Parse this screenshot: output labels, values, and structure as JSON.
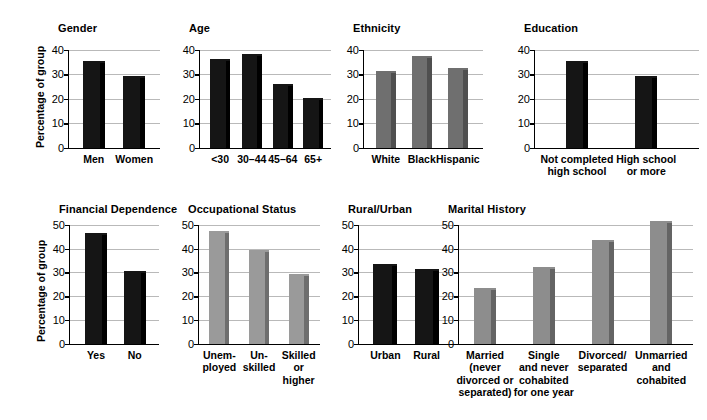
{
  "figure": {
    "ylabel": "Percentage of group",
    "bar_colors": {
      "black": "#151515",
      "black_edge": "#000000",
      "dark_gray": "#6f6f6f",
      "dark_gray_edge": "#4f4f4f",
      "mid_gray": "#8d8d8d",
      "mid_gray_edge": "#646464",
      "light_gray": "#9a9a9a",
      "light_gray_edge": "#6e6e6e",
      "gridline": "#b9b9b9",
      "axis": "#000000"
    }
  },
  "chart_data": [
    {
      "type": "bar",
      "title": "Gender",
      "xlabel": "",
      "ylabel": "Percentage of group",
      "ylim": [
        0,
        40
      ],
      "yticks": [
        0,
        10,
        20,
        30,
        40
      ],
      "grid": true,
      "bar_style": "black",
      "categories": [
        "Men",
        "Women"
      ],
      "values": [
        35.5,
        29.5
      ]
    },
    {
      "type": "bar",
      "title": "Age",
      "xlabel": "",
      "ylabel": "",
      "ylim": [
        0,
        40
      ],
      "yticks": [
        0,
        10,
        20,
        30,
        40
      ],
      "grid": true,
      "bar_style": "black",
      "categories": [
        "<30",
        "30–44",
        "45–64",
        "65+"
      ],
      "values": [
        36.5,
        38.5,
        26.0,
        20.5
      ]
    },
    {
      "type": "bar",
      "title": "Ethnicity",
      "xlabel": "",
      "ylabel": "",
      "ylim": [
        0,
        40
      ],
      "yticks": [
        0,
        10,
        20,
        30,
        40
      ],
      "grid": true,
      "bar_style": "dark_gray",
      "categories": [
        "White",
        "Black",
        "Hispanic"
      ],
      "values": [
        31.5,
        37.5,
        32.5
      ]
    },
    {
      "type": "bar",
      "title": "Education",
      "xlabel": "",
      "ylabel": "",
      "ylim": [
        0,
        40
      ],
      "yticks": [
        0,
        10,
        20,
        30,
        40
      ],
      "grid": true,
      "bar_style": "black",
      "categories": [
        "Not completed\nhigh school",
        "High school\nor more"
      ],
      "values": [
        35.5,
        29.5
      ]
    },
    {
      "type": "bar",
      "title": "Financial Dependence",
      "xlabel": "",
      "ylabel": "Percentage of group",
      "ylim": [
        0,
        50
      ],
      "yticks": [
        0,
        10,
        20,
        30,
        40,
        50
      ],
      "grid": true,
      "bar_style": "black",
      "categories": [
        "Yes",
        "No"
      ],
      "values": [
        46.5,
        30.5
      ]
    },
    {
      "type": "bar",
      "title": "Occupational Status",
      "xlabel": "",
      "ylabel": "",
      "ylim": [
        0,
        50
      ],
      "yticks": [
        0,
        10,
        20,
        30,
        40,
        50
      ],
      "grid": true,
      "bar_style": "light_gray",
      "categories": [
        "Unem-\nployed",
        "Un-\nskilled",
        "Skilled\nor\nhigher"
      ],
      "values": [
        47.5,
        39.5,
        29.5
      ]
    },
    {
      "type": "bar",
      "title": "Rural/Urban",
      "xlabel": "",
      "ylabel": "",
      "ylim": [
        0,
        50
      ],
      "yticks": [
        0,
        10,
        20,
        30,
        40,
        50
      ],
      "grid": true,
      "bar_style": "black",
      "categories": [
        "Urban",
        "Rural"
      ],
      "values": [
        33.5,
        31.5
      ]
    },
    {
      "type": "bar",
      "title": "Marital History",
      "xlabel": "",
      "ylabel": "",
      "ylim": [
        0,
        50
      ],
      "yticks": [
        0,
        10,
        20,
        30,
        40,
        50
      ],
      "grid": true,
      "bar_style": "mid_gray",
      "categories": [
        "Married\n(never\ndivorced or\nseparated)",
        "Single\nand never\ncohabited\nfor one year",
        "Divorced/\nseparated",
        "Unmarried\nand\ncohabited"
      ],
      "values": [
        23.5,
        32.5,
        43.5,
        51.5
      ]
    }
  ],
  "layout": [
    {
      "title_x": 58,
      "title_y": 22,
      "plot_x": 68,
      "plot_y": 50,
      "plot_w": 92,
      "plot_h": 99,
      "ylabel_x": 34,
      "ylabel_y": 148,
      "bar_w": 22,
      "label_w": 54,
      "slots": [
        0.28,
        0.72
      ]
    },
    {
      "title_x": 189,
      "title_y": 22,
      "plot_x": 199,
      "plot_y": 50,
      "plot_w": 132,
      "plot_h": 99,
      "bar_w": 20,
      "label_w": 34,
      "slots": [
        0.16,
        0.4,
        0.635,
        0.865
      ]
    },
    {
      "title_x": 353,
      "title_y": 22,
      "plot_x": 363,
      "plot_y": 50,
      "plot_w": 120,
      "plot_h": 99,
      "bar_w": 20,
      "label_w": 48,
      "slots": [
        0.19,
        0.49,
        0.79
      ]
    },
    {
      "title_x": 524,
      "title_y": 22,
      "plot_x": 534,
      "plot_y": 50,
      "plot_w": 165,
      "plot_h": 99,
      "bar_w": 22,
      "label_w": 90,
      "slots": [
        0.26,
        0.68
      ]
    },
    {
      "title_x": 59,
      "title_y": 203,
      "plot_x": 69,
      "plot_y": 225,
      "plot_w": 90,
      "plot_h": 120,
      "ylabel_x": 35,
      "ylabel_y": 342,
      "bar_w": 22,
      "label_w": 40,
      "slots": [
        0.3,
        0.73
      ]
    },
    {
      "title_x": 188,
      "title_y": 203,
      "plot_x": 198,
      "plot_y": 225,
      "plot_w": 122,
      "plot_h": 120,
      "bar_w": 20,
      "label_w": 44,
      "slots": [
        0.175,
        0.5,
        0.825
      ]
    },
    {
      "title_x": 348,
      "title_y": 203,
      "plot_x": 358,
      "plot_y": 225,
      "plot_w": 98,
      "plot_h": 120,
      "bar_w": 24,
      "label_w": 46,
      "slots": [
        0.28,
        0.7
      ]
    },
    {
      "title_x": 448,
      "title_y": 203,
      "plot_x": 458,
      "plot_y": 225,
      "plot_w": 235,
      "plot_h": 120,
      "bar_w": 22,
      "label_w": 70,
      "slots": [
        0.115,
        0.365,
        0.615,
        0.865
      ]
    }
  ]
}
